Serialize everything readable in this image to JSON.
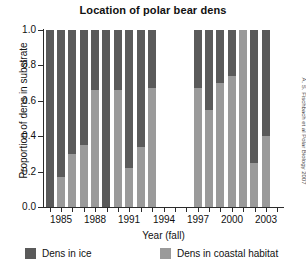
{
  "chart_data": {
    "type": "bar",
    "title": "Location of polar bear dens",
    "xlabel": "Year (fall)",
    "ylabel": "Proportion of dens in substrate",
    "ylim": [
      0.0,
      1.0
    ],
    "yticks": [
      "0.0",
      "0.2",
      "0.4",
      "0.6",
      "0.8",
      "1.0"
    ],
    "ytick_values": [
      0.0,
      0.2,
      0.4,
      0.6,
      0.8,
      1.0
    ],
    "xticks": [
      "1985",
      "1988",
      "1991",
      "1994",
      "1997",
      "2000",
      "2003"
    ],
    "xtick_values": [
      1985,
      1988,
      1991,
      1994,
      1997,
      2000,
      2003
    ],
    "grid": false,
    "stacked": true,
    "legend_position": "bottom",
    "categories": [
      1984,
      1985,
      1986,
      1987,
      1988,
      1989,
      1990,
      1991,
      1992,
      1993,
      1997,
      1998,
      1999,
      2000,
      2001,
      2002,
      2003
    ],
    "missing_years": [
      1994,
      1995,
      1996
    ],
    "series": [
      {
        "name": "Dens in coastal habitat",
        "color": "#9a9a9a",
        "values": [
          0.0,
          0.17,
          0.3,
          0.35,
          0.66,
          0.0,
          0.66,
          0.22,
          0.34,
          0.67,
          0.67,
          0.55,
          0.7,
          0.74,
          1.0,
          0.25,
          0.4
        ]
      },
      {
        "name": "Dens in ice",
        "color": "#5a5a5a",
        "values": [
          1.0,
          0.83,
          0.7,
          0.65,
          0.34,
          1.0,
          0.34,
          0.78,
          0.66,
          0.33,
          0.33,
          0.45,
          0.3,
          0.26,
          0.0,
          0.75,
          0.6
        ]
      }
    ],
    "annotations": [
      "A. S. Fischbach et al Polar Biology 2007"
    ]
  },
  "legend": {
    "items": [
      {
        "label": "Dens in ice",
        "color": "#5a5a5a"
      },
      {
        "label": "Dens in coastal habitat",
        "color": "#9a9a9a"
      }
    ]
  },
  "credit": "A. S. Fischbach et al Polar Biology 2007"
}
